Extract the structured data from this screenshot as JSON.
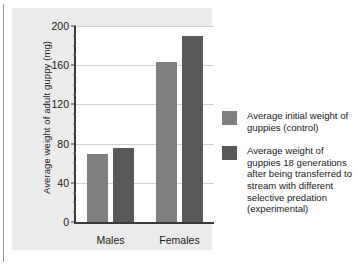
{
  "chart_data": {
    "type": "bar",
    "title": "",
    "xlabel": "",
    "ylabel": "Average weight of adult guppy (mg)",
    "categories": [
      "Males",
      "Females"
    ],
    "series": [
      {
        "name": "Average initial weight of guppies (control)",
        "color": "#808080",
        "values": [
          69,
          163
        ]
      },
      {
        "name": "Average weight of guppies 18 generations after being transferred to stream with different selective predation (experimental)",
        "color": "#595959",
        "values": [
          76,
          190
        ]
      }
    ],
    "ylim": [
      0,
      200
    ],
    "yticks": [
      0,
      40,
      80,
      120,
      160,
      200
    ],
    "ytick_labels": [
      "0",
      "40",
      "80",
      "120",
      "160",
      "200"
    ],
    "yminor_ticks": [
      10,
      20,
      30,
      50,
      60,
      70,
      90,
      100,
      110,
      130,
      140,
      150,
      170,
      180,
      190
    ],
    "grid": true,
    "legend_position": "right"
  },
  "legend": {
    "entries": [
      {
        "swatch_color": "#808080",
        "label": "Average initial weight of guppies (control)"
      },
      {
        "swatch_color": "#595959",
        "label": "Average weight of guppies 18 generations after being transferred to stream with different selective predation (experimental)"
      }
    ]
  },
  "colors": {
    "control_bar": "#808080",
    "experimental_bar": "#595959",
    "panel_background": "#ebebeb",
    "plot_background": "#ffffff",
    "axis": "#3a3a3a",
    "gridline": "#d2d2d2",
    "text": "#1a1a1a"
  }
}
